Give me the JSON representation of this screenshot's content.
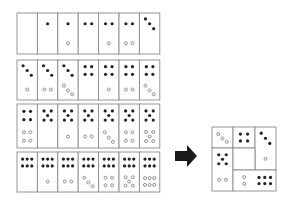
{
  "colors": {
    "stroke": "#8a8a8a",
    "filled": "#222222",
    "open_stroke": "#777777",
    "arrow": "#1a1a1a",
    "bg": "#ffffff"
  },
  "grid": {
    "x": 17,
    "cell_w": 20.4,
    "rows": [
      {
        "y": 13,
        "h": 41,
        "cells": [
          {
            "top": "none",
            "bottom": "none"
          },
          {
            "top": "f1",
            "bottom": "none"
          },
          {
            "top": "f1",
            "bottom": "o1"
          },
          {
            "top": "f2",
            "bottom": "none"
          },
          {
            "top": "f2",
            "bottom": "o1"
          },
          {
            "top": "f2",
            "bottom": "o2"
          },
          {
            "top": "f3",
            "bottom": "none"
          }
        ]
      },
      {
        "y": 60,
        "h": 40,
        "cells": [
          {
            "top": "f3",
            "bottom": "o1"
          },
          {
            "top": "f3",
            "bottom": "o2"
          },
          {
            "top": "f3",
            "bottom": "o3"
          },
          {
            "top": "f4",
            "bottom": "none"
          },
          {
            "top": "f4",
            "bottom": "o1"
          },
          {
            "top": "f4",
            "bottom": "o2"
          },
          {
            "top": "f4",
            "bottom": "o3"
          }
        ]
      },
      {
        "y": 104,
        "h": 44,
        "cells": [
          {
            "top": "f4",
            "bottom": "o4"
          },
          {
            "top": "f5",
            "bottom": "none"
          },
          {
            "top": "f5",
            "bottom": "o1"
          },
          {
            "top": "f5",
            "bottom": "o2"
          },
          {
            "top": "f5",
            "bottom": "o3"
          },
          {
            "top": "f5",
            "bottom": "o4"
          },
          {
            "top": "f5",
            "bottom": "o5"
          }
        ]
      },
      {
        "y": 152,
        "h": 40,
        "cells": [
          {
            "top": "f6",
            "bottom": "none"
          },
          {
            "top": "f6",
            "bottom": "o1"
          },
          {
            "top": "f6",
            "bottom": "o2"
          },
          {
            "top": "f6",
            "bottom": "o3"
          },
          {
            "top": "f6",
            "bottom": "o4"
          },
          {
            "top": "f6",
            "bottom": "o5"
          },
          {
            "top": "f6",
            "bottom": "o6"
          }
        ]
      }
    ]
  },
  "arrow": {
    "x": 175,
    "y": 145,
    "w": 22,
    "h": 22,
    "direction": "right"
  },
  "result": {
    "x": 212,
    "y": 127,
    "size": 64,
    "tiles": [
      {
        "x": 0,
        "y": 0,
        "w": 21,
        "h": 21,
        "pips": "o3"
      },
      {
        "x": 21,
        "y": 0,
        "w": 22,
        "h": 21,
        "pips": "f4"
      },
      {
        "x": 43,
        "y": 0,
        "w": 21,
        "h": 43,
        "pips": "f3|o1"
      },
      {
        "x": 0,
        "y": 21,
        "w": 21,
        "h": 43,
        "pips": "f5|o2"
      },
      {
        "x": 21,
        "y": 21,
        "w": 22,
        "h": 22,
        "pips": "none"
      },
      {
        "x": 21,
        "y": 43,
        "w": 43,
        "h": 21,
        "pips": "o2v|f6"
      }
    ]
  }
}
